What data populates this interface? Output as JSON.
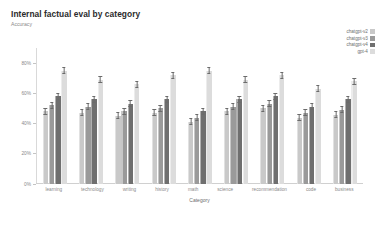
{
  "header": {
    "title": "Internal factual eval by category",
    "subtitle": "Accuracy"
  },
  "axes": {
    "xlabel": "Category",
    "ylabel": "Accuracy",
    "yticks": [
      "80%",
      "60%",
      "40%",
      "20%",
      "0%"
    ]
  },
  "legend": {
    "position": "top-right",
    "entries": [
      {
        "label": "chatgpt-v2",
        "color": "#c9c9c9"
      },
      {
        "label": "chatgpt-v3",
        "color": "#9a9a9a"
      },
      {
        "label": "chatgpt-v4",
        "color": "#6f6f6f"
      },
      {
        "label": "gpt-4",
        "color": "#dcdcdc"
      }
    ]
  },
  "chart_data": {
    "type": "bar",
    "title": "Internal factual eval by category",
    "subtitle": "Accuracy",
    "xlabel": "Category",
    "ylabel": "Accuracy",
    "ylim": [
      0,
      90
    ],
    "ytick_values": [
      80,
      60,
      40,
      20,
      0
    ],
    "grid": false,
    "error_bars": true,
    "categories": [
      "learning",
      "technology",
      "writing",
      "history",
      "math",
      "science",
      "recommendation",
      "code",
      "business"
    ],
    "series": [
      {
        "name": "chatgpt-v2",
        "color": "#c9c9c9",
        "values": [
          48,
          47,
          45,
          47,
          41,
          48,
          50,
          44,
          46
        ],
        "errors": [
          2,
          2,
          2,
          2,
          2,
          2,
          2,
          2,
          2
        ]
      },
      {
        "name": "chatgpt-v3",
        "color": "#9a9a9a",
        "values": [
          52,
          51,
          48,
          50,
          44,
          51,
          53,
          47,
          49
        ],
        "errors": [
          2,
          2,
          2,
          2,
          2,
          2,
          2,
          2,
          2
        ]
      },
      {
        "name": "chatgpt-v4",
        "color": "#6f6f6f",
        "values": [
          58,
          56,
          53,
          56,
          48,
          56,
          58,
          51,
          56
        ],
        "errors": [
          2,
          2,
          2,
          2,
          2,
          2,
          2,
          2,
          2
        ]
      },
      {
        "name": "gpt-4",
        "color": "#dcdcdc",
        "values": [
          75,
          69,
          66,
          72,
          75,
          69,
          72,
          63,
          68
        ],
        "errors": [
          2,
          2,
          2,
          2,
          2,
          2,
          2,
          2,
          2
        ]
      }
    ]
  }
}
